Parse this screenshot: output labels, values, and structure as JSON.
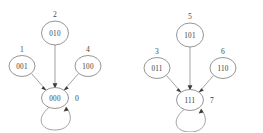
{
  "diagram": {
    "type": "state-transition-graph",
    "background_color": "#ffffff",
    "node_stroke_color": "#7b7b7b",
    "edge_stroke_color": "#8a8a8a",
    "text_color": "#3a3a3a",
    "clusters": [
      {
        "id": "cluster-left",
        "sink": {
          "id": "node-000",
          "label": "000",
          "cx": 55,
          "cy": 98,
          "rx": 13.5,
          "ry": 10.5,
          "self_loop": {
            "id": "loop-000",
            "label": "0",
            "label_x": 77,
            "label_y": 98
          }
        },
        "sources": [
          {
            "id": "node-001",
            "label": "001",
            "index": "1",
            "cx": 22,
            "cy": 66,
            "rx": 13,
            "ry": 10.5,
            "index_x": 22,
            "index_y": 49
          },
          {
            "id": "node-010",
            "label": "010",
            "index": "2",
            "cx": 55,
            "cy": 33,
            "rx": 13.5,
            "ry": 12,
            "index_x": 55,
            "index_y": 14
          },
          {
            "id": "node-100",
            "label": "100",
            "index": "4",
            "cx": 88,
            "cy": 66,
            "rx": 13,
            "ry": 10.5,
            "index_x": 88,
            "index_y": 49
          }
        ],
        "edges": [
          {
            "id": "edge-001-000",
            "from": "node-001",
            "to": "node-000"
          },
          {
            "id": "edge-010-000",
            "from": "node-010",
            "to": "node-000"
          },
          {
            "id": "edge-100-000",
            "from": "node-100",
            "to": "node-000"
          }
        ]
      },
      {
        "id": "cluster-right",
        "sink": {
          "id": "node-111",
          "label": "111",
          "cx": 190,
          "cy": 100,
          "rx": 13.5,
          "ry": 10.5,
          "self_loop": {
            "id": "loop-111",
            "label": "7",
            "label_x": 212,
            "label_y": 100
          }
        },
        "sources": [
          {
            "id": "node-011",
            "label": "011",
            "index": "3",
            "cx": 157,
            "cy": 68,
            "rx": 13,
            "ry": 10.5,
            "index_x": 157,
            "index_y": 51
          },
          {
            "id": "node-101",
            "label": "101",
            "index": "5",
            "cx": 190,
            "cy": 35,
            "rx": 13.5,
            "ry": 12,
            "index_x": 190,
            "index_y": 16
          },
          {
            "id": "node-110",
            "label": "110",
            "index": "6",
            "cx": 223,
            "cy": 68,
            "rx": 13,
            "ry": 10.5,
            "index_x": 223,
            "index_y": 51
          }
        ],
        "edges": [
          {
            "id": "edge-011-111",
            "from": "node-011",
            "to": "node-111"
          },
          {
            "id": "edge-101-111",
            "from": "node-101",
            "to": "node-111"
          },
          {
            "id": "edge-110-111",
            "from": "node-110",
            "to": "node-111"
          }
        ]
      }
    ]
  }
}
